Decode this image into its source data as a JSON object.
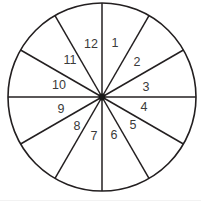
{
  "figure": {
    "name": "twelve-sector-circle-diagram",
    "title": "",
    "background_color": "#ffffff",
    "stroke_color": "#231f20",
    "label_color": "#3a3a3a",
    "hub_color": "#1a1a1a",
    "footer_rule_color": "#f2f2f2",
    "geometry": {
      "center_x": 102,
      "center_y": 97,
      "radius": 94,
      "sector_count": 12,
      "sector_angle_degrees": 30,
      "start_angle_degrees": -90
    },
    "sectors": [
      {
        "id": "sector-1",
        "label": "1",
        "label_x": 115,
        "label_y": 44,
        "mid_angle_degrees": -75
      },
      {
        "id": "sector-2",
        "label": "2",
        "label_x": 137,
        "label_y": 63,
        "mid_angle_degrees": -45
      },
      {
        "id": "sector-3",
        "label": "3",
        "label_x": 146,
        "label_y": 88,
        "mid_angle_degrees": -15
      },
      {
        "id": "sector-4",
        "label": "4",
        "label_x": 144,
        "label_y": 108,
        "mid_angle_degrees": 15
      },
      {
        "id": "sector-5",
        "label": "5",
        "label_x": 133,
        "label_y": 126,
        "mid_angle_degrees": 45
      },
      {
        "id": "sector-6",
        "label": "6",
        "label_x": 114,
        "label_y": 136,
        "mid_angle_degrees": 75
      },
      {
        "id": "sector-7",
        "label": "7",
        "label_x": 94,
        "label_y": 137,
        "mid_angle_degrees": 105
      },
      {
        "id": "sector-8",
        "label": "8",
        "label_x": 77,
        "label_y": 127,
        "mid_angle_degrees": 135
      },
      {
        "id": "sector-9",
        "label": "9",
        "label_x": 61,
        "label_y": 110,
        "mid_angle_degrees": 165
      },
      {
        "id": "sector-10",
        "label": "10",
        "label_x": 59,
        "label_y": 86,
        "mid_angle_degrees": -165
      },
      {
        "id": "sector-11",
        "label": "11",
        "label_x": 70,
        "label_y": 61,
        "mid_angle_degrees": -135
      },
      {
        "id": "sector-12",
        "label": "12",
        "label_x": 91,
        "label_y": 45,
        "mid_angle_degrees": -105
      }
    ]
  }
}
